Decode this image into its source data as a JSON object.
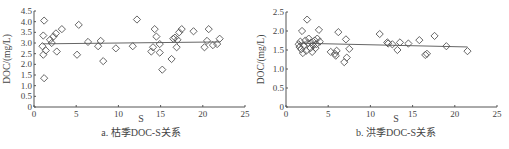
{
  "chart_data": [
    {
      "type": "scatter",
      "title": "",
      "caption": "a. 枯季DOC-S关系",
      "xlabel": "S",
      "ylabel": "DOC/(mg/L)",
      "xlim": [
        0,
        25
      ],
      "ylim": [
        0,
        4.5
      ],
      "xticks": [
        "0",
        "5",
        "10",
        "15",
        "20",
        "25"
      ],
      "yticks": [
        "0",
        "0.5",
        "1.0",
        "1.5",
        "2.0",
        "2.5",
        "3.0",
        "3.5",
        "4.0",
        "4.5"
      ],
      "grid": false,
      "marker": "open-diamond",
      "trendline": {
        "x": [
          1.0,
          22.0
        ],
        "y": [
          2.96,
          3.05
        ]
      },
      "points": [
        [
          1.2,
          4.05
        ],
        [
          1.1,
          3.35
        ],
        [
          1.0,
          2.85
        ],
        [
          1.1,
          2.45
        ],
        [
          1.2,
          1.35
        ],
        [
          1.4,
          2.65
        ],
        [
          2.1,
          3.0
        ],
        [
          2.3,
          3.3
        ],
        [
          1.9,
          3.15
        ],
        [
          2.6,
          3.45
        ],
        [
          2.7,
          2.6
        ],
        [
          3.3,
          3.65
        ],
        [
          5.1,
          2.45
        ],
        [
          5.3,
          3.85
        ],
        [
          6.4,
          3.05
        ],
        [
          7.6,
          2.85
        ],
        [
          7.9,
          3.1
        ],
        [
          8.2,
          2.15
        ],
        [
          9.7,
          2.75
        ],
        [
          11.7,
          2.85
        ],
        [
          12.2,
          4.1
        ],
        [
          13.9,
          2.6
        ],
        [
          14.1,
          2.8
        ],
        [
          14.3,
          3.65
        ],
        [
          14.5,
          3.3
        ],
        [
          14.9,
          2.95
        ],
        [
          14.9,
          2.55
        ],
        [
          15.2,
          1.75
        ],
        [
          16.3,
          2.25
        ],
        [
          16.5,
          3.2
        ],
        [
          16.7,
          3.25
        ],
        [
          16.9,
          2.8
        ],
        [
          17.0,
          3.15
        ],
        [
          17.2,
          3.5
        ],
        [
          17.5,
          3.65
        ],
        [
          18.9,
          3.55
        ],
        [
          20.2,
          2.8
        ],
        [
          20.5,
          3.1
        ],
        [
          20.7,
          3.65
        ],
        [
          21.2,
          2.9
        ],
        [
          21.7,
          2.95
        ],
        [
          22.0,
          3.2
        ]
      ]
    },
    {
      "type": "scatter",
      "title": "",
      "caption": "b. 洪季DOC-S关系",
      "xlabel": "S",
      "ylabel": "DOC/(mg/L)",
      "xlim": [
        0,
        25
      ],
      "ylim": [
        0,
        2.5
      ],
      "xticks": [
        "0",
        "5",
        "10",
        "15",
        "20",
        "25"
      ],
      "yticks": [
        "0",
        "0.5",
        "1.0",
        "1.5",
        "2.0",
        "2.5"
      ],
      "grid": false,
      "marker": "open-diamond",
      "trendline": {
        "x": [
          1.5,
          21.5
        ],
        "y": [
          1.68,
          1.58
        ]
      },
      "points": [
        [
          1.5,
          1.65
        ],
        [
          1.6,
          1.58
        ],
        [
          1.7,
          1.72
        ],
        [
          1.8,
          1.52
        ],
        [
          1.9,
          2.0
        ],
        [
          2.0,
          1.42
        ],
        [
          2.1,
          1.62
        ],
        [
          2.3,
          1.75
        ],
        [
          2.4,
          1.48
        ],
        [
          2.5,
          2.3
        ],
        [
          2.6,
          1.68
        ],
        [
          2.7,
          1.8
        ],
        [
          2.9,
          1.55
        ],
        [
          3.0,
          1.7
        ],
        [
          3.1,
          1.45
        ],
        [
          3.2,
          1.62
        ],
        [
          3.4,
          1.75
        ],
        [
          3.5,
          1.55
        ],
        [
          3.6,
          1.65
        ],
        [
          3.7,
          1.8
        ],
        [
          3.9,
          2.03
        ],
        [
          4.0,
          1.72
        ],
        [
          5.3,
          1.45
        ],
        [
          5.8,
          1.4
        ],
        [
          5.9,
          1.35
        ],
        [
          6.0,
          1.48
        ],
        [
          6.2,
          1.97
        ],
        [
          6.9,
          1.18
        ],
        [
          7.1,
          1.78
        ],
        [
          7.2,
          1.3
        ],
        [
          7.5,
          1.53
        ],
        [
          11.1,
          1.92
        ],
        [
          12.0,
          1.7
        ],
        [
          12.1,
          1.67
        ],
        [
          12.6,
          1.65
        ],
        [
          13.2,
          1.5
        ],
        [
          13.5,
          1.7
        ],
        [
          14.5,
          1.67
        ],
        [
          15.8,
          1.76
        ],
        [
          16.5,
          1.37
        ],
        [
          16.7,
          1.4
        ],
        [
          17.6,
          1.87
        ],
        [
          19.0,
          1.6
        ],
        [
          21.5,
          1.47
        ]
      ]
    }
  ]
}
